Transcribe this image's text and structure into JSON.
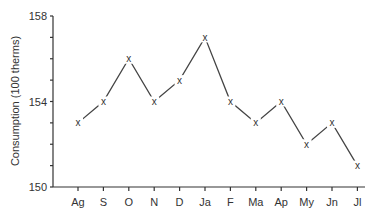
{
  "chart_data": {
    "type": "line",
    "title": "",
    "xlabel": "",
    "ylabel": "Consumption (100 therms)",
    "categories": [
      "Ag",
      "S",
      "O",
      "N",
      "D",
      "Ja",
      "F",
      "Ma",
      "Ap",
      "My",
      "Jn",
      "Jl"
    ],
    "series": [
      {
        "name": "Consumption",
        "values": [
          153,
          154,
          156,
          154,
          155,
          157,
          154,
          153,
          154,
          152,
          153,
          151
        ],
        "marker": "x"
      }
    ],
    "ylim": [
      150,
      158
    ],
    "yticks_labeled": [
      150,
      154,
      158
    ],
    "yticks_minor_step": 1,
    "grid": false,
    "legend": "none"
  }
}
